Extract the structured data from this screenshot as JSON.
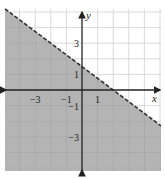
{
  "chart_data": {
    "type": "area",
    "title": "",
    "xlabel": "x",
    "ylabel": "y",
    "xlim": [
      -5,
      5
    ],
    "ylim": [
      -5.2,
      5.2
    ],
    "grid": true,
    "x_tick_labels": [
      {
        "value": -3,
        "label": "−3"
      },
      {
        "value": -1,
        "label": "−1"
      },
      {
        "value": 1,
        "label": "1"
      }
    ],
    "y_tick_labels": [
      {
        "value": 3,
        "label": "3"
      },
      {
        "value": 1,
        "label": "1"
      },
      {
        "value": -1,
        "label": "−1"
      },
      {
        "value": -3,
        "label": "−3"
      }
    ],
    "boundary_line": {
      "style": "dashed",
      "equation": "y = -0.75x + 1.5",
      "points": [
        [
          -5,
          5.25
        ],
        [
          0,
          1.5
        ],
        [
          2,
          0
        ],
        [
          5,
          -2.25
        ]
      ]
    },
    "shaded_region": "below",
    "colors": {
      "shade": "#b4b4b4",
      "grid": "#d0d0d0",
      "grid_on_shade": "#9e9e9e",
      "axis": "#222222",
      "line": "#333333"
    }
  }
}
